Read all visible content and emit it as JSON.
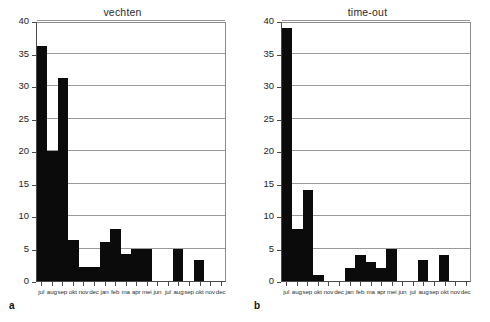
{
  "figure": {
    "background": "#ffffff",
    "bar_color": "#0b0b0b",
    "grid_color": "#9a9a9a",
    "axis_color": "#4a4a4a"
  },
  "panels": [
    {
      "key": "a",
      "title": "vechten",
      "chart_data": {
        "type": "bar",
        "title": "vechten",
        "xlabel": "",
        "ylabel": "",
        "ylim": [
          0,
          40
        ],
        "yticks": [
          0,
          5,
          10,
          15,
          20,
          25,
          30,
          35,
          40
        ],
        "grid": true,
        "legend": "none",
        "categories": [
          "jul",
          "aug",
          "sep",
          "okt",
          "nov",
          "dec",
          "jan",
          "feb",
          "ma",
          "apr",
          "mei",
          "jun",
          "jul",
          "aug",
          "sep",
          "okt",
          "nov",
          "dec"
        ],
        "values": [
          36.2,
          20.0,
          31.2,
          6.3,
          2.2,
          2.2,
          6.0,
          8.0,
          4.2,
          5.0,
          5.0,
          0,
          0,
          5.0,
          0,
          3.3,
          0,
          0
        ]
      }
    },
    {
      "key": "b",
      "title": "time-out",
      "chart_data": {
        "type": "bar",
        "title": "time-out",
        "xlabel": "",
        "ylabel": "",
        "ylim": [
          0,
          40
        ],
        "yticks": [
          0,
          5,
          10,
          15,
          20,
          25,
          30,
          35,
          40
        ],
        "grid": true,
        "legend": "none",
        "categories": [
          "jul",
          "aug",
          "sep",
          "okt",
          "nov",
          "dec",
          "jan",
          "feb",
          "ma",
          "apr",
          "mei",
          "jun",
          "jul",
          "aug",
          "sep",
          "okt",
          "nov",
          "dec"
        ],
        "values": [
          39.0,
          8.0,
          14.0,
          1.0,
          0,
          0,
          2.0,
          4.0,
          3.0,
          2.0,
          5.0,
          0,
          0,
          3.2,
          0,
          4.0,
          0,
          0
        ]
      }
    }
  ],
  "chart_data": [
    {
      "type": "bar",
      "title": "vechten",
      "panel": "a",
      "xlabel": "",
      "ylabel": "",
      "ylim": [
        0,
        40
      ],
      "yticks": [
        0,
        5,
        10,
        15,
        20,
        25,
        30,
        35,
        40
      ],
      "grid": true,
      "categories": [
        "jul",
        "aug",
        "sep",
        "okt",
        "nov",
        "dec",
        "jan",
        "feb",
        "ma",
        "apr",
        "mei",
        "jun",
        "jul",
        "aug",
        "sep",
        "okt",
        "nov",
        "dec"
      ],
      "values": [
        36.2,
        20.0,
        31.2,
        6.3,
        2.2,
        2.2,
        6.0,
        8.0,
        4.2,
        5.0,
        5.0,
        0,
        0,
        5.0,
        0,
        3.3,
        0,
        0
      ]
    },
    {
      "type": "bar",
      "title": "time-out",
      "panel": "b",
      "xlabel": "",
      "ylabel": "",
      "ylim": [
        0,
        40
      ],
      "yticks": [
        0,
        5,
        10,
        15,
        20,
        25,
        30,
        35,
        40
      ],
      "grid": true,
      "categories": [
        "jul",
        "aug",
        "sep",
        "okt",
        "nov",
        "dec",
        "jan",
        "feb",
        "ma",
        "apr",
        "mei",
        "jun",
        "jul",
        "aug",
        "sep",
        "okt",
        "nov",
        "dec"
      ],
      "values": [
        39.0,
        8.0,
        14.0,
        1.0,
        0,
        0,
        2.0,
        4.0,
        3.0,
        2.0,
        5.0,
        0,
        0,
        3.2,
        0,
        4.0,
        0,
        0
      ]
    }
  ]
}
